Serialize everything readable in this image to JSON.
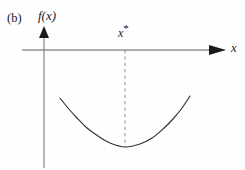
{
  "figure": {
    "panel_label": "(b)",
    "background_color": "#fefefe",
    "axis_color": "#5a5a5a",
    "curve_color": "#333333",
    "dash_color": "#8c8c8c",
    "text_color": "#1a1a1a"
  },
  "labels": {
    "y_axis": "f(x)",
    "x_axis": "x",
    "optimum_point": "x",
    "optimum_superscript": "*"
  },
  "chart_data": {
    "type": "line",
    "title": "(b)",
    "xlabel": "x",
    "ylabel": "f(x)",
    "grid": false,
    "legend": null,
    "annotations": [
      {
        "text": "x*",
        "kind": "minimizer-marker",
        "x_px": 125,
        "description": "dashed vertical line from x-axis down to curve minimum"
      }
    ],
    "axes": {
      "x_axis_y_px": 50,
      "x_axis_start_px": 22,
      "x_axis_end_px": 226,
      "x_axis_arrow": true,
      "y_axis_x_px": 44,
      "y_axis_top_px": 27,
      "y_axis_bottom_px": 168,
      "y_axis_arrow": true
    },
    "series": [
      {
        "name": "f(x)",
        "shape": "convex-parabola",
        "points_px": [
          [
            60,
            98
          ],
          [
            68,
            108
          ],
          [
            77,
            118
          ],
          [
            87,
            128
          ],
          [
            98,
            136
          ],
          [
            110,
            143
          ],
          [
            125,
            147
          ],
          [
            140,
            144
          ],
          [
            152,
            138
          ],
          [
            163,
            129
          ],
          [
            173,
            119
          ],
          [
            182,
            108
          ],
          [
            190,
            96
          ]
        ],
        "minimum_px": [
          125,
          147
        ]
      }
    ],
    "dashed_line_px": {
      "x": 125,
      "y_start": 50,
      "y_end": 147
    }
  }
}
